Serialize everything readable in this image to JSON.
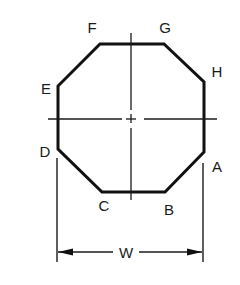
{
  "diagram": {
    "type": "octagon-dimension-drawing",
    "vertices": {
      "A": {
        "label": "A"
      },
      "B": {
        "label": "B"
      },
      "C": {
        "label": "C"
      },
      "D": {
        "label": "D"
      },
      "E": {
        "label": "E"
      },
      "F": {
        "label": "F"
      },
      "G": {
        "label": "G"
      },
      "H": {
        "label": "H"
      }
    },
    "dimension": {
      "label": "W"
    },
    "colors": {
      "stroke": "#111111",
      "background": "#ffffff"
    }
  }
}
